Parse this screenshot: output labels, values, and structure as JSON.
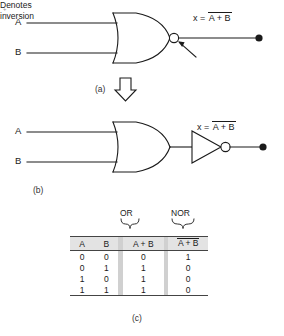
{
  "figure": {
    "panels": {
      "a_label": "(a)",
      "b_label": "(b)",
      "c_label": "(c)"
    },
    "speck": "+"
  },
  "panel_a": {
    "input_a": "A",
    "input_b": "B",
    "gate": "nor-gate",
    "equation": {
      "lhs": "x =",
      "overbar_expr": "A + B"
    },
    "annotation_line1": "Denotes",
    "annotation_line2": "inversion"
  },
  "panel_b": {
    "input_a": "A",
    "input_b": "B",
    "gate1": "or-gate",
    "gate2": "not-gate",
    "equation": {
      "lhs": "x =",
      "overbar_expr": "A + B"
    }
  },
  "truth_table": {
    "group_or": "OR",
    "group_nor": "NOR",
    "headers": {
      "a": "A",
      "b": "B",
      "or": "A + B",
      "nor": "A + B"
    },
    "rows": [
      {
        "a": "0",
        "b": "0",
        "or": "0",
        "nor": "1"
      },
      {
        "a": "0",
        "b": "1",
        "or": "1",
        "nor": "0"
      },
      {
        "a": "1",
        "b": "0",
        "or": "1",
        "nor": "0"
      },
      {
        "a": "1",
        "b": "1",
        "or": "1",
        "nor": "0"
      }
    ]
  },
  "colors": {
    "ink": "#1a1a1a",
    "header_fill": "#e3e3e3",
    "separator_fill": "#d0d0d0",
    "page": "#ffffff"
  }
}
